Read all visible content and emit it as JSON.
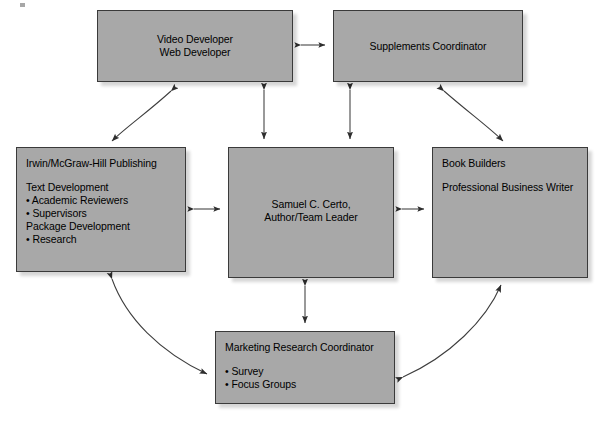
{
  "diagram": {
    "style": {
      "box_fill": "#a8a8a8",
      "box_border": "#3a3a3a",
      "line_color": "#3d3d3d",
      "text_color": "#000000",
      "background": "#ffffff"
    },
    "nodes": [
      {
        "id": "video-web-developer",
        "title": "Video Developer",
        "subtitle": "Web Developer",
        "align": "center",
        "x": 97,
        "y": 10,
        "w": 196,
        "h": 72
      },
      {
        "id": "supplements-coordinator",
        "title": "Supplements Coordinator",
        "subtitle": "",
        "align": "center",
        "x": 333,
        "y": 10,
        "w": 190,
        "h": 72
      },
      {
        "id": "irwin-mcgraw-hill-publishing",
        "title": "Irwin/McGraw-Hill Publishing",
        "subtitle": "",
        "align": "left",
        "x": 16,
        "y": 147,
        "w": 170,
        "h": 125,
        "body_heading": "Text Development",
        "body_heading2": "Package Development",
        "bullets": [
          "• Academic Reviewers",
          "• Supervisors"
        ],
        "bullets2": [
          "• Research"
        ]
      },
      {
        "id": "samuel-certo-team-leader",
        "title": "Samuel C. Certo,",
        "subtitle": "Author/Team Leader",
        "align": "center",
        "x": 228,
        "y": 147,
        "w": 166,
        "h": 131
      },
      {
        "id": "book-builders",
        "title": "Book Builders",
        "subtitle": "Professional Business Writer",
        "align": "left",
        "x": 432,
        "y": 147,
        "w": 156,
        "h": 131
      },
      {
        "id": "marketing-research-coordinator",
        "title": "Marketing Research Coordinator",
        "subtitle": "",
        "align": "left",
        "x": 215,
        "y": 331,
        "w": 180,
        "h": 73,
        "bullets": [
          "• Survey",
          "• Focus Groups"
        ]
      }
    ],
    "edges": [
      {
        "id": "video-to-supplements",
        "kind": "straight",
        "arrows": "both",
        "from": "video-web-developer",
        "to": "supplements-coordinator"
      },
      {
        "id": "video-to-certo",
        "kind": "straight",
        "arrows": "both",
        "from": "video-web-developer",
        "to": "samuel-certo-team-leader"
      },
      {
        "id": "supplements-to-certo",
        "kind": "straight",
        "arrows": "both",
        "from": "supplements-coordinator",
        "to": "samuel-certo-team-leader"
      },
      {
        "id": "irwin-to-certo",
        "kind": "straight",
        "arrows": "both",
        "from": "irwin-mcgraw-hill-publishing",
        "to": "samuel-certo-team-leader"
      },
      {
        "id": "certo-to-book-builders",
        "kind": "straight",
        "arrows": "both",
        "from": "samuel-certo-team-leader",
        "to": "book-builders"
      },
      {
        "id": "certo-to-marketing",
        "kind": "straight",
        "arrows": "both",
        "from": "samuel-certo-team-leader",
        "to": "marketing-research-coordinator"
      },
      {
        "id": "video-to-irwin-curve",
        "kind": "curve",
        "arrows": "both",
        "from": "video-web-developer",
        "to": "irwin-mcgraw-hill-publishing"
      },
      {
        "id": "supplements-to-book-builders-curve",
        "kind": "curve",
        "arrows": "both",
        "from": "supplements-coordinator",
        "to": "book-builders"
      },
      {
        "id": "irwin-to-marketing-curve",
        "kind": "curve",
        "arrows": "both",
        "from": "irwin-mcgraw-hill-publishing",
        "to": "marketing-research-coordinator"
      },
      {
        "id": "marketing-to-book-builders-curve",
        "kind": "curve",
        "arrows": "both",
        "from": "marketing-research-coordinator",
        "to": "book-builders"
      }
    ]
  }
}
